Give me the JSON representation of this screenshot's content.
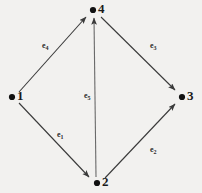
{
  "figure": {
    "kind": "directed-graph",
    "background_color": "#f2f1ef",
    "stroke_color": "#3a3a3a",
    "node_color": "#111111",
    "label_color": "#1a1a1a"
  },
  "nodes": [
    {
      "id": "1",
      "label": "1",
      "dot_x": 12,
      "dot_y": 97,
      "label_x": 17,
      "label_y": 90
    },
    {
      "id": "2",
      "label": "2",
      "dot_x": 97,
      "dot_y": 183,
      "label_x": 102,
      "label_y": 176
    },
    {
      "id": "3",
      "label": "3",
      "dot_x": 182,
      "dot_y": 97,
      "label_x": 187,
      "label_y": 90
    },
    {
      "id": "4",
      "label": "4",
      "dot_x": 93,
      "dot_y": 10,
      "label_x": 98,
      "label_y": 3
    }
  ],
  "edges": [
    {
      "id": "e1",
      "label": "e",
      "sub": "1",
      "from": "1",
      "to": "2",
      "label_x": 57,
      "label_y": 132
    },
    {
      "id": "e2",
      "label": "e",
      "sub": "2",
      "from": "2",
      "to": "3",
      "label_x": 150,
      "label_y": 146
    },
    {
      "id": "e3",
      "label": "e",
      "sub": "3",
      "from": "4",
      "to": "3",
      "label_x": 150,
      "label_y": 42
    },
    {
      "id": "e4",
      "label": "e",
      "sub": "4",
      "from": "1",
      "to": "4",
      "label_x": 42,
      "label_y": 42
    },
    {
      "id": "e5",
      "label": "e",
      "sub": "5",
      "from": "2",
      "to": "4",
      "label_x": 87,
      "label_y": 92
    }
  ],
  "dot_markers": {
    "node1": "●",
    "node2": "●",
    "node3": "●",
    "node4": "●"
  }
}
